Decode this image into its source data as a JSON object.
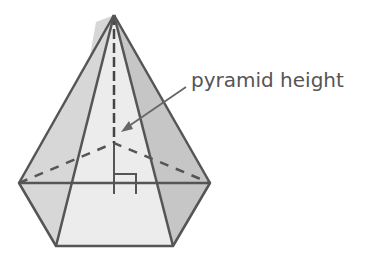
{
  "diagram": {
    "label": "pyramid height",
    "annotations": [
      "right-angle-marker",
      "height-arrow"
    ],
    "colors": {
      "edge": "#555555",
      "left_face": "#d7d7d7",
      "front_face": "#ececec",
      "right_face": "#c6c6c6",
      "label": "#555555"
    }
  }
}
